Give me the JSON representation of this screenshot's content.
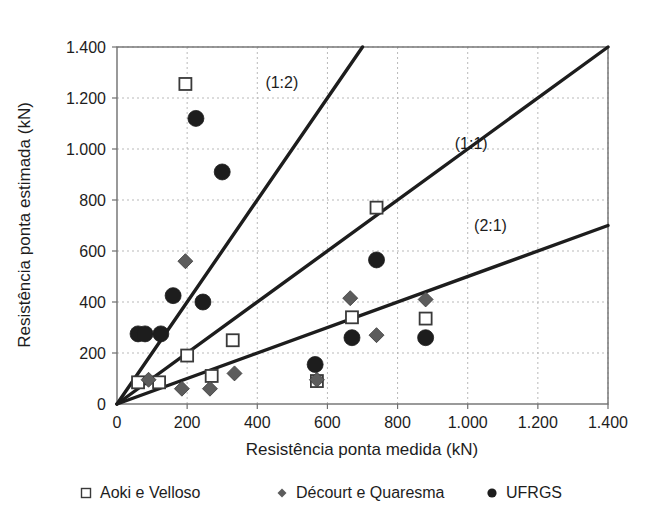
{
  "chart_data": {
    "type": "scatter",
    "title": "",
    "xlabel": "Resistência ponta medida (kN)",
    "ylabel": "Resistência ponta estimada (kN)",
    "xlim": [
      0,
      1400
    ],
    "ylim": [
      0,
      1400
    ],
    "grid": true,
    "legend_position": "bottom",
    "xticks": [
      0,
      200,
      400,
      600,
      800,
      1000,
      1200,
      1400
    ],
    "xtick_labels": [
      "0",
      "200",
      "400",
      "600",
      "800",
      "1.000",
      "1.200",
      "1.400"
    ],
    "yticks": [
      0,
      200,
      400,
      600,
      800,
      1000,
      1200,
      1400
    ],
    "ytick_labels": [
      "0",
      "200",
      "400",
      "600",
      "800",
      "1.000",
      "1.200",
      "1.400"
    ],
    "annotations": [
      {
        "text": "(1:2)",
        "x": 470,
        "y": 1240,
        "slope": 2.0
      },
      {
        "text": "(1:1)",
        "x": 1010,
        "y": 1000,
        "slope": 1.0
      },
      {
        "text": "(2:1)",
        "x": 1065,
        "y": 680,
        "slope": 0.5
      }
    ],
    "reference_lines": [
      {
        "name": "(1:2)",
        "slope": 2.0,
        "from": [
          0,
          0
        ],
        "to": [
          700,
          1400
        ]
      },
      {
        "name": "(1:1)",
        "slope": 1.0,
        "from": [
          0,
          0
        ],
        "to": [
          1400,
          1400
        ]
      },
      {
        "name": "(2:1)",
        "slope": 0.5,
        "from": [
          0,
          0
        ],
        "to": [
          1400,
          700
        ]
      }
    ],
    "series": [
      {
        "name": "Aoki e Velloso",
        "marker": "open-square",
        "color": "#ffffff",
        "edge_color": "#3a3a3a",
        "points": [
          {
            "x": 60,
            "y": 85
          },
          {
            "x": 120,
            "y": 85
          },
          {
            "x": 195,
            "y": 1255
          },
          {
            "x": 200,
            "y": 190
          },
          {
            "x": 270,
            "y": 110
          },
          {
            "x": 330,
            "y": 250
          },
          {
            "x": 570,
            "y": 90
          },
          {
            "x": 670,
            "y": 340
          },
          {
            "x": 740,
            "y": 770
          },
          {
            "x": 880,
            "y": 335
          }
        ]
      },
      {
        "name": "Décourt e Quaresma",
        "marker": "filled-diamond",
        "color": "#5c5c5c",
        "edge_color": "#3a3a3a",
        "points": [
          {
            "x": 90,
            "y": 95
          },
          {
            "x": 185,
            "y": 60
          },
          {
            "x": 195,
            "y": 560
          },
          {
            "x": 265,
            "y": 60
          },
          {
            "x": 335,
            "y": 120
          },
          {
            "x": 570,
            "y": 95
          },
          {
            "x": 665,
            "y": 415
          },
          {
            "x": 740,
            "y": 270
          },
          {
            "x": 880,
            "y": 410
          }
        ]
      },
      {
        "name": "UFRGS",
        "marker": "filled-circle",
        "color": "#1d1d1d",
        "edge_color": "#1d1d1d",
        "points": [
          {
            "x": 60,
            "y": 275
          },
          {
            "x": 80,
            "y": 275
          },
          {
            "x": 125,
            "y": 275
          },
          {
            "x": 160,
            "y": 425
          },
          {
            "x": 245,
            "y": 400
          },
          {
            "x": 225,
            "y": 1120
          },
          {
            "x": 300,
            "y": 910
          },
          {
            "x": 565,
            "y": 155
          },
          {
            "x": 670,
            "y": 260
          },
          {
            "x": 740,
            "y": 565
          },
          {
            "x": 880,
            "y": 260
          }
        ]
      }
    ]
  },
  "legend": {
    "items": [
      {
        "label": "Aoki e Velloso",
        "marker": "open-square"
      },
      {
        "label": "Décourt e Quaresma",
        "marker": "filled-diamond"
      },
      {
        "label": "UFRGS",
        "marker": "filled-circle"
      }
    ]
  },
  "colors": {
    "axis": "#6f6f6f",
    "grid": "#b9b9b9",
    "line": "#1d1d1d",
    "text": "#1d1d1d",
    "marker_open": "#ffffff",
    "marker_diamond": "#5c5c5c",
    "marker_circle": "#1d1d1d",
    "background": "#ffffff"
  }
}
